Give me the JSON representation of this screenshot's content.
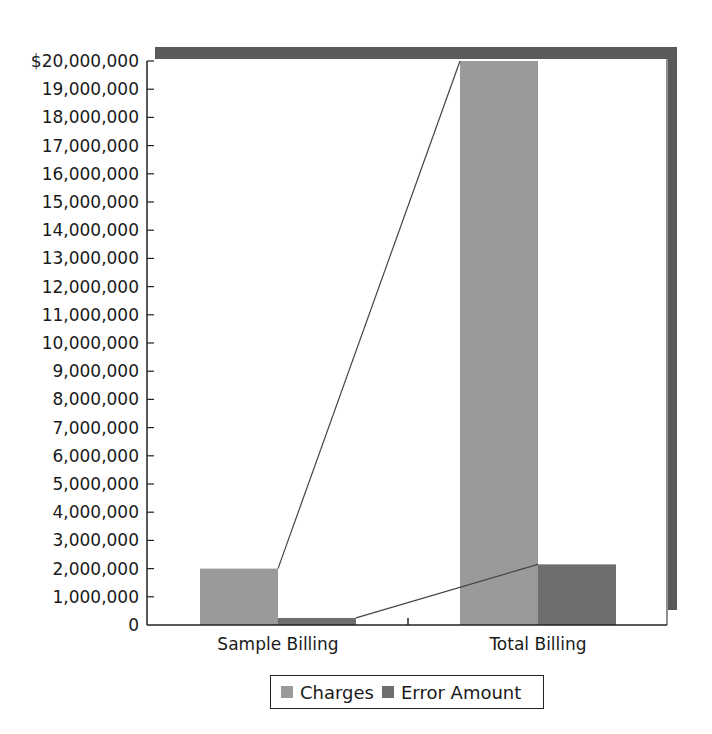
{
  "chart_data": {
    "type": "bar",
    "title": "",
    "xlabel": "",
    "ylabel": "",
    "categories": [
      "Sample Billing",
      "Total Billing"
    ],
    "series": [
      {
        "name": "Charges",
        "color": "#9a9a9a",
        "values": [
          2000000,
          20000000
        ]
      },
      {
        "name": "Error Amount",
        "color": "#6e6e6e",
        "values": [
          250000,
          2150000
        ]
      }
    ],
    "ylim": [
      0,
      20000000
    ],
    "yticks": [
      0,
      1000000,
      2000000,
      3000000,
      4000000,
      5000000,
      6000000,
      7000000,
      8000000,
      9000000,
      10000000,
      11000000,
      12000000,
      13000000,
      14000000,
      15000000,
      16000000,
      17000000,
      18000000,
      19000000,
      20000000
    ],
    "ytick_labels": [
      "0",
      "1,000,000",
      "2,000,000",
      "3,000,000",
      "4,000,000",
      "5,000,000",
      "6,000,000",
      "7,000,000",
      "8,000,000",
      "9,000,000",
      "10,000,000",
      "11,000,000",
      "12,000,000",
      "13,000,000",
      "14,000,000",
      "15,000,000",
      "16,000,000",
      "17,000,000",
      "18,000,000",
      "19,000,000",
      "$20,000,000"
    ],
    "grid": false,
    "legend_position": "bottom",
    "annotations": [
      "Connector lines link Sample Billing bars to the tops of corresponding Total Billing bars",
      "3D-style dark drop shadow on plot frame (top and right)"
    ]
  },
  "legend": {
    "items": [
      {
        "label": "Charges",
        "color": "#9a9a9a"
      },
      {
        "label": "Error Amount",
        "color": "#6e6e6e"
      }
    ]
  },
  "colors": {
    "frame_shadow": "#5a5a5a",
    "axis": "#222222",
    "connector": "#444444"
  }
}
